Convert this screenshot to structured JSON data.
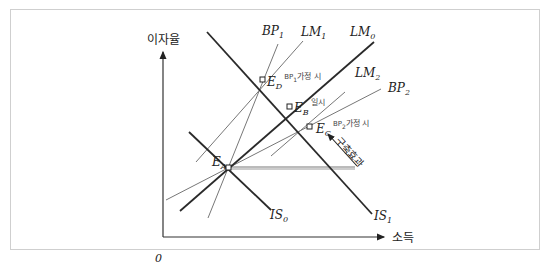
{
  "diagram": {
    "type": "IS-LM-BP diagram",
    "axes": {
      "y_label": "이자율",
      "x_label": "소득",
      "origin_label": "0"
    },
    "curves": {
      "IS0": {
        "name": "IS",
        "sub": "0"
      },
      "IS1": {
        "name": "IS",
        "sub": "1"
      },
      "LM0": {
        "name": "LM",
        "sub": "0"
      },
      "LM1": {
        "name": "LM",
        "sub": "1"
      },
      "LM2": {
        "name": "LM",
        "sub": "2"
      },
      "BP1": {
        "name": "BP",
        "sub": "1"
      },
      "BP2": {
        "name": "BP",
        "sub": "2"
      }
    },
    "points": {
      "EA": {
        "name": "E",
        "sub": "A",
        "note": ""
      },
      "EB": {
        "name": "E",
        "sub": "B",
        "note": "일시"
      },
      "EC": {
        "name": "E",
        "sub": "C",
        "note_pre": "BP",
        "note_sub": "2",
        "note": "가정 시"
      },
      "ED": {
        "name": "E",
        "sub": "D",
        "note_pre": "BP",
        "note_sub": "1",
        "note": "가정 시"
      }
    },
    "annotation": {
      "crowding_out": "구축효과"
    },
    "colors": {
      "thick_line": "#2a2a2a",
      "thin_line": "#7a7a7a",
      "frame": "#cfcfcf"
    }
  }
}
